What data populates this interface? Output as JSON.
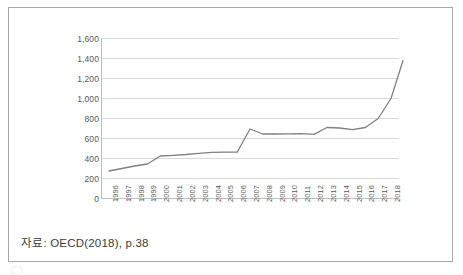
{
  "figure": {
    "caption": "자료: OECD(2018), p.38"
  },
  "chart_data": {
    "type": "line",
    "title": "",
    "xlabel": "",
    "ylabel": "",
    "grid": true,
    "legend": null,
    "ylim": [
      0,
      1600
    ],
    "yticks": [
      0,
      200,
      400,
      600,
      800,
      1000,
      1200,
      1400,
      1600
    ],
    "ytick_labels": [
      "0",
      "200",
      "400",
      "600",
      "800",
      "1,000",
      "1,200",
      "1,400",
      "1,600"
    ],
    "categories": [
      "1996",
      "1997",
      "1998",
      "1999",
      "2000",
      "2001",
      "2002",
      "2003",
      "2004",
      "2005",
      "2006",
      "2007",
      "2008",
      "2009",
      "2010",
      "2011",
      "2012",
      "2013",
      "2014",
      "2015",
      "2016",
      "2017",
      "2018"
    ],
    "values": [
      275,
      300,
      325,
      345,
      425,
      432,
      440,
      452,
      462,
      463,
      463,
      695,
      645,
      645,
      647,
      648,
      641,
      710,
      705,
      688,
      710,
      800,
      1000
    ],
    "final_value": 1380,
    "line_color": "#808080",
    "grid_color": "#d9d9d9",
    "axis_color": "#bfbfbf"
  }
}
